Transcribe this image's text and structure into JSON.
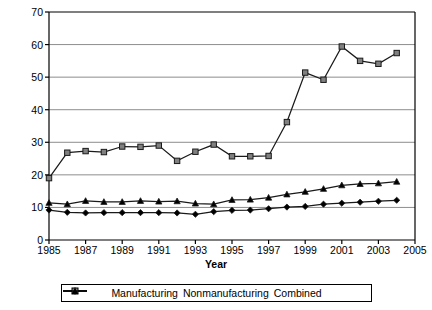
{
  "chart_data": {
    "type": "line",
    "title": "",
    "xlabel": "Year",
    "ylabel": "Value Added (dollars/GO)",
    "xlim": [
      1985,
      2005
    ],
    "ylim": [
      0,
      70
    ],
    "ytick_step": 10,
    "xtick_step": 2,
    "grid": true,
    "legend_position": "bottom",
    "x": [
      1985,
      1986,
      1987,
      1988,
      1989,
      1990,
      1991,
      1992,
      1993,
      1994,
      1995,
      1996,
      1997,
      1998,
      1999,
      2000,
      2001,
      2002,
      2003,
      2004
    ],
    "yticks": [
      "0",
      "10",
      "20",
      "30",
      "40",
      "50",
      "60",
      "70"
    ],
    "xticks": [
      "1985",
      "1987",
      "1989",
      "1991",
      "1993",
      "1995",
      "1997",
      "1999",
      "2001",
      "2003",
      "2005"
    ],
    "series": [
      {
        "name": "Manufacturing",
        "marker": "diamond",
        "color": "#000000",
        "values": [
          9.2,
          8.5,
          8.3,
          8.4,
          8.4,
          8.4,
          8.4,
          8.3,
          7.9,
          8.7,
          9.1,
          9.2,
          9.6,
          10.1,
          10.3,
          11.0,
          11.3,
          11.6,
          11.9,
          12.2
        ]
      },
      {
        "name": "Nonmanufacturing",
        "marker": "square",
        "color": "#808080",
        "values": [
          19.0,
          26.8,
          27.3,
          27.0,
          28.7,
          28.6,
          29.0,
          24.3,
          27.1,
          29.3,
          25.7,
          25.7,
          25.8,
          36.2,
          51.4,
          49.2,
          59.4,
          55.0,
          54.1,
          57.4
        ]
      },
      {
        "name": "Combined",
        "marker": "triangle",
        "color": "#000000",
        "values": [
          11.4,
          11.0,
          12.0,
          11.7,
          11.7,
          12.0,
          11.8,
          11.9,
          11.2,
          11.0,
          12.3,
          12.4,
          13.0,
          14.0,
          14.8,
          15.7,
          16.8,
          17.2,
          17.4,
          17.9
        ]
      }
    ]
  },
  "legend": {
    "items": [
      {
        "label": "Manufacturing"
      },
      {
        "label": "Nonmanufacturing"
      },
      {
        "label": "Combined"
      }
    ]
  }
}
